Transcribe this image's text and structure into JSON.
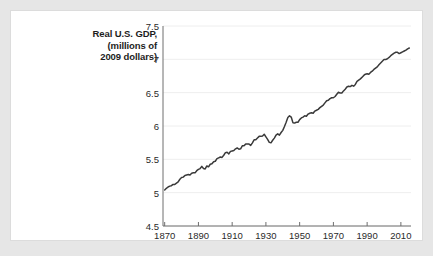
{
  "page": {
    "background_color": "#e6e6e6",
    "card_background": "#ffffff"
  },
  "chart_data": {
    "type": "line",
    "title": "Real U.S. GDP, (millions of 2009 dollars)",
    "title_lines": [
      "Real U.S. GDP,",
      "(millions of",
      "2009 dollars)"
    ],
    "xlabel": "",
    "ylabel": "Real U.S. GDP, (millions of 2009 dollars)",
    "grid": true,
    "legend_position": "none",
    "line_color": "#3a3a3a",
    "axis_color": "#6e6e6e",
    "grid_color": "#eeeeee",
    "xlim": [
      1869,
      2016
    ],
    "ylim": [
      4.5,
      7.5
    ],
    "xticks": [
      1870,
      1890,
      1910,
      1930,
      1950,
      1970,
      1990,
      2010
    ],
    "xticklabels": [
      "1870",
      "1890",
      "1910",
      "1930",
      "1950",
      "1970",
      "1990",
      "2010"
    ],
    "yticks": [
      4.5,
      5,
      5.5,
      6,
      6.5,
      7,
      7.5
    ],
    "yticklabels": [
      "4.5",
      "5",
      "5.5",
      "6",
      "6.5",
      "7",
      "7.5"
    ],
    "series": [
      {
        "name": "Real U.S. GDP (log scale, millions of 2009 dollars)",
        "x": [
          1870,
          1871,
          1872,
          1873,
          1874,
          1875,
          1876,
          1877,
          1878,
          1879,
          1880,
          1881,
          1882,
          1883,
          1884,
          1885,
          1886,
          1887,
          1888,
          1889,
          1890,
          1891,
          1892,
          1893,
          1894,
          1895,
          1896,
          1897,
          1898,
          1899,
          1900,
          1901,
          1902,
          1903,
          1904,
          1905,
          1906,
          1907,
          1908,
          1909,
          1910,
          1911,
          1912,
          1913,
          1914,
          1915,
          1916,
          1917,
          1918,
          1919,
          1920,
          1921,
          1922,
          1923,
          1924,
          1925,
          1926,
          1927,
          1928,
          1929,
          1930,
          1931,
          1932,
          1933,
          1934,
          1935,
          1936,
          1937,
          1938,
          1939,
          1940,
          1941,
          1942,
          1943,
          1944,
          1945,
          1946,
          1947,
          1948,
          1949,
          1950,
          1951,
          1952,
          1953,
          1954,
          1955,
          1956,
          1957,
          1958,
          1959,
          1960,
          1961,
          1962,
          1963,
          1964,
          1965,
          1966,
          1967,
          1968,
          1969,
          1970,
          1971,
          1972,
          1973,
          1974,
          1975,
          1976,
          1977,
          1978,
          1979,
          1980,
          1981,
          1982,
          1983,
          1984,
          1985,
          1986,
          1987,
          1988,
          1989,
          1990,
          1991,
          1992,
          1993,
          1994,
          1995,
          1996,
          1997,
          1998,
          1999,
          2000,
          2001,
          2002,
          2003,
          2004,
          2005,
          2006,
          2007,
          2008,
          2009,
          2010,
          2011,
          2012,
          2013,
          2014,
          2015
        ],
        "y": [
          5.04,
          5.08,
          5.11,
          5.13,
          5.14,
          5.17,
          5.17,
          5.2,
          5.23,
          5.29,
          5.33,
          5.34,
          5.38,
          5.39,
          5.4,
          5.39,
          5.43,
          5.44,
          5.44,
          5.49,
          5.52,
          5.54,
          5.59,
          5.54,
          5.53,
          5.6,
          5.58,
          5.64,
          5.65,
          5.7,
          5.71,
          5.77,
          5.79,
          5.81,
          5.8,
          5.85,
          5.91,
          5.92,
          5.88,
          5.94,
          5.95,
          5.96,
          6.0,
          6.02,
          5.99,
          6.0,
          6.07,
          6.07,
          6.11,
          6.11,
          6.11,
          6.08,
          6.14,
          6.21,
          6.21,
          6.25,
          6.29,
          6.29,
          6.3,
          6.34,
          6.28,
          6.22,
          6.15,
          6.14,
          6.2,
          6.25,
          6.32,
          6.35,
          6.32,
          6.38,
          6.43,
          6.52,
          6.62,
          6.73,
          6.77,
          6.74,
          6.61,
          6.6,
          6.62,
          6.62,
          6.68,
          6.72,
          6.74,
          6.77,
          6.76,
          6.81,
          6.83,
          6.84,
          6.83,
          6.88,
          6.9,
          6.92,
          6.96,
          6.99,
          7.02,
          7.07,
          7.12,
          7.13,
          7.17,
          7.19,
          7.19,
          7.22,
          7.27,
          7.32,
          7.3,
          7.3,
          7.35,
          7.39,
          7.44,
          7.46,
          7.45,
          7.48,
          7.46,
          7.5,
          7.57,
          7.6,
          7.63,
          7.67,
          7.71,
          7.74,
          7.75,
          7.74,
          7.78,
          7.81,
          7.85,
          7.88,
          7.91,
          7.96,
          8.0,
          8.04,
          8.08,
          8.08,
          8.1,
          8.13,
          8.17,
          8.2,
          8.23,
          8.25,
          8.25,
          8.22,
          8.24,
          8.26,
          8.28,
          8.3,
          8.33,
          8.35
        ]
      }
    ],
    "annotations": []
  }
}
